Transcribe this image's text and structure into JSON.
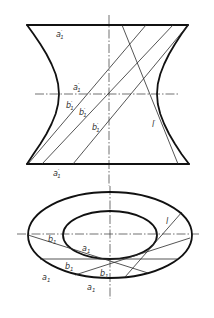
{
  "figure": {
    "front_view": {
      "labels": [
        {
          "letter": "a",
          "prime": "′",
          "sub": "1"
        },
        {
          "letter": "a",
          "prime": "′",
          "sub": "1"
        },
        {
          "letter": "b",
          "prime": "′",
          "sub": "1"
        },
        {
          "letter": "b",
          "prime": "′",
          "sub": "1"
        },
        {
          "letter": "b",
          "prime": "′",
          "sub": "1"
        },
        {
          "letter": "l",
          "prime": "′",
          "sub": ""
        },
        {
          "letter": "a",
          "prime": "′",
          "sub": "1"
        }
      ]
    },
    "top_view": {
      "labels": [
        {
          "letter": "l",
          "sub": ""
        },
        {
          "letter": "b",
          "sub": "1"
        },
        {
          "letter": "a",
          "sub": "1"
        },
        {
          "letter": "b",
          "sub": "1"
        },
        {
          "letter": "a",
          "sub": "1"
        },
        {
          "letter": "b",
          "sub": "1"
        },
        {
          "letter": "a",
          "sub": "1"
        }
      ]
    }
  }
}
